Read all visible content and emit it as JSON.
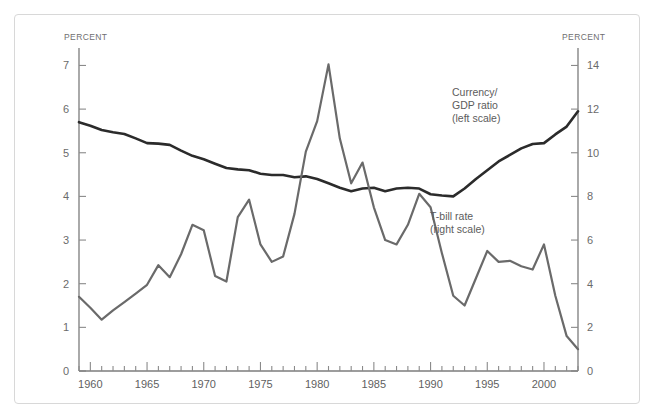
{
  "figure": {
    "left_axis_label": "PERCENT",
    "right_axis_label": "PERCENT",
    "frame_color": "#d8d8d8",
    "background": "#ffffff"
  },
  "chart_data": {
    "type": "line",
    "title": "",
    "xlabel": "",
    "grid": false,
    "legend_position": "inline-annotations",
    "xlim": [
      1959,
      2003
    ],
    "x_ticks_major": [
      1960,
      1965,
      1970,
      1975,
      1980,
      1985,
      1990,
      1995,
      2000
    ],
    "x_tick_interval_minor": 1,
    "axes": [
      {
        "id": "left",
        "label": "PERCENT",
        "ylim": [
          0,
          7.4
        ],
        "ticks": [
          0,
          1,
          2,
          3,
          4,
          5,
          6,
          7
        ],
        "tick_labels": [
          "0",
          "1",
          "2",
          "3",
          "4",
          "5",
          "6",
          "7"
        ]
      },
      {
        "id": "right",
        "label": "PERCENT",
        "ylim": [
          0,
          14.8
        ],
        "ticks": [
          0,
          2,
          4,
          6,
          8,
          10,
          12,
          14
        ],
        "tick_labels": [
          "0",
          "2",
          "4",
          "6",
          "8",
          "10",
          "12",
          "14"
        ]
      }
    ],
    "x": [
      1959,
      1960,
      1961,
      1962,
      1963,
      1964,
      1965,
      1966,
      1967,
      1968,
      1969,
      1970,
      1971,
      1972,
      1973,
      1974,
      1975,
      1976,
      1977,
      1978,
      1979,
      1980,
      1981,
      1982,
      1983,
      1984,
      1985,
      1986,
      1987,
      1988,
      1989,
      1990,
      1991,
      1992,
      1993,
      1994,
      1995,
      1996,
      1997,
      1998,
      1999,
      2000,
      2001,
      2002,
      2003
    ],
    "series": [
      {
        "name": "Currency/GDP ratio (left scale)",
        "axis": "left",
        "color": "#2b2b2b",
        "width": 2.6,
        "annotation": "Currency/\nGDP ratio\n(left scale)",
        "values": [
          5.7,
          5.62,
          5.52,
          5.47,
          5.43,
          5.33,
          5.22,
          5.21,
          5.18,
          5.05,
          4.93,
          4.85,
          4.75,
          4.65,
          4.62,
          4.6,
          4.52,
          4.49,
          4.49,
          4.44,
          4.46,
          4.4,
          4.3,
          4.2,
          4.12,
          4.18,
          4.2,
          4.12,
          4.18,
          4.2,
          4.18,
          4.05,
          4.02,
          4.0,
          4.18,
          4.4,
          4.6,
          4.8,
          4.95,
          5.1,
          5.2,
          5.22,
          5.42,
          5.6,
          5.95
        ]
      },
      {
        "name": "T-bill rate (right scale)",
        "axis": "right",
        "color": "#6a6a6a",
        "width": 2.2,
        "annotation": "T-bill rate\n(right scale)",
        "values": [
          3.4,
          2.9,
          2.35,
          2.78,
          3.16,
          3.55,
          3.95,
          4.85,
          4.3,
          5.35,
          6.7,
          6.45,
          4.35,
          4.1,
          7.05,
          7.85,
          5.8,
          5.0,
          5.25,
          7.2,
          10.05,
          11.45,
          14.05,
          10.65,
          8.6,
          9.55,
          7.5,
          6.0,
          5.8,
          6.7,
          8.12,
          7.5,
          5.4,
          3.45,
          3.0,
          4.25,
          5.5,
          5.0,
          5.05,
          4.8,
          4.65,
          5.8,
          3.45,
          1.6,
          1.0
        ]
      }
    ]
  },
  "annotations": [
    {
      "id": "currency-gdp-label",
      "lines": [
        "Currency/",
        "GDP ratio",
        "(left scale)"
      ],
      "x": 452,
      "y": 96
    },
    {
      "id": "tbill-label",
      "lines": [
        "T-bill rate",
        "(right scale)"
      ],
      "x": 430,
      "y": 220
    }
  ]
}
